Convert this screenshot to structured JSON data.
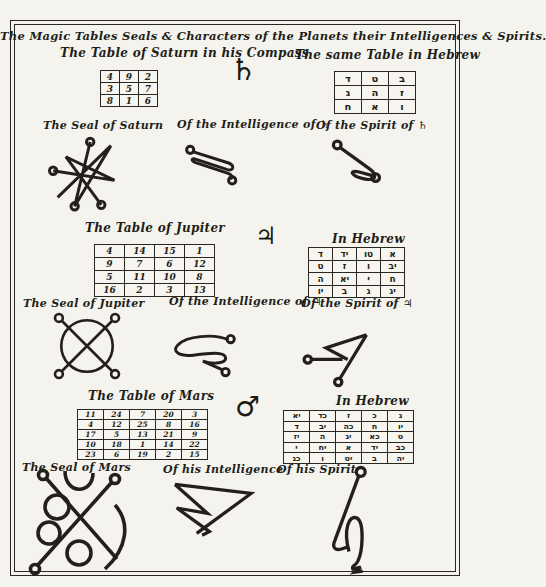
{
  "page": {
    "title": "The Magic Tables Seals & Characters of the Planets their Intelligences & Spirits."
  },
  "colors": {
    "ink": "#211e19",
    "paper": "#f5f3ed"
  },
  "saturn": {
    "table_label": "The Table of Saturn in his Compass",
    "hebrew_label": "The same Table in Hebrew",
    "symbol": "♄",
    "square": [
      [
        "4",
        "9",
        "2"
      ],
      [
        "3",
        "5",
        "7"
      ],
      [
        "8",
        "1",
        "6"
      ]
    ],
    "hebrew_square": [
      [
        "ד",
        "ט",
        "ב"
      ],
      [
        "ג",
        "ה",
        "ז"
      ],
      [
        "ח",
        "א",
        "ו"
      ]
    ],
    "seal_label": "The Seal of Saturn",
    "intelligence_label": "Of the Intelligence of ♄",
    "spirit_label": "Of the Spirit of ♄"
  },
  "jupiter": {
    "table_label": "The Table of Jupiter",
    "hebrew_label": "In Hebrew",
    "symbol": "♃",
    "square": [
      [
        "4",
        "14",
        "15",
        "1"
      ],
      [
        "9",
        "7",
        "6",
        "12"
      ],
      [
        "5",
        "11",
        "10",
        "8"
      ],
      [
        "16",
        "2",
        "3",
        "13"
      ]
    ],
    "hebrew_square": [
      [
        "ד",
        "יד",
        "טו",
        "א"
      ],
      [
        "ט",
        "ז",
        "ו",
        "יב"
      ],
      [
        "ה",
        "יא",
        "י",
        "ח"
      ],
      [
        "יו",
        "ב",
        "ג",
        "יג"
      ]
    ],
    "seal_label": "The Seal of Jupiter",
    "intelligence_label": "Of the Intelligence of ♃",
    "spirit_label": "Of the Spirit of ♃"
  },
  "mars": {
    "table_label": "The Table of Mars",
    "hebrew_label": "In Hebrew",
    "symbol": "♂",
    "square": [
      [
        "11",
        "24",
        "7",
        "20",
        "3"
      ],
      [
        "4",
        "12",
        "25",
        "8",
        "16"
      ],
      [
        "17",
        "5",
        "13",
        "21",
        "9"
      ],
      [
        "10",
        "18",
        "1",
        "14",
        "22"
      ],
      [
        "23",
        "6",
        "19",
        "2",
        "15"
      ]
    ],
    "hebrew_square": [
      [
        "יא",
        "כד",
        "ז",
        "כ",
        "ג"
      ],
      [
        "ד",
        "יב",
        "כה",
        "ח",
        "יו"
      ],
      [
        "יז",
        "ה",
        "יג",
        "כא",
        "ט"
      ],
      [
        "י",
        "יח",
        "א",
        "יד",
        "כב"
      ],
      [
        "כג",
        "ו",
        "יט",
        "ב",
        "יה"
      ]
    ],
    "seal_label": "The Seal of Mars",
    "intelligence_label": "Of his Intelligence",
    "spirit_label": "Of his Spirit"
  }
}
